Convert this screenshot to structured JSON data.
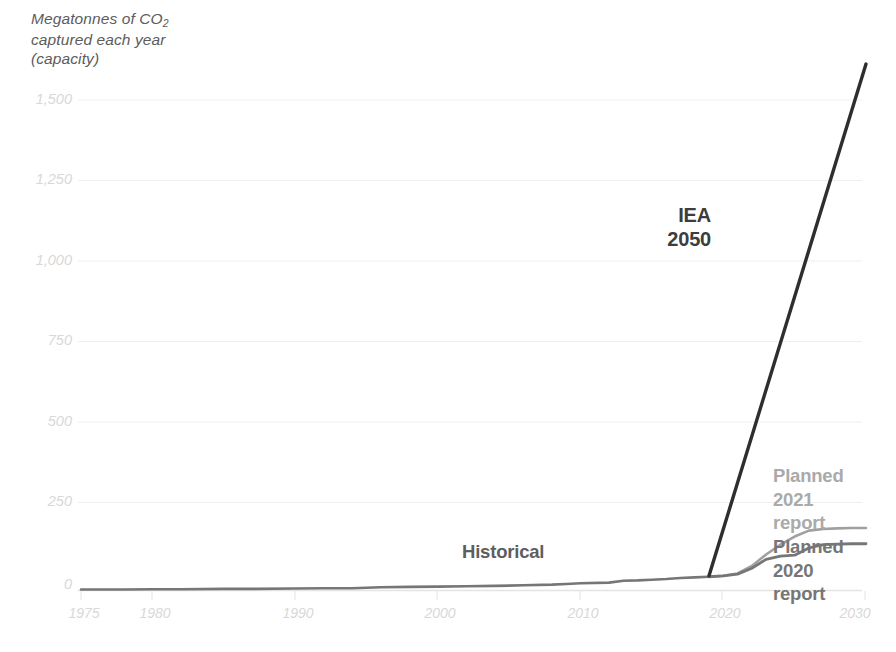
{
  "chart_data": {
    "type": "line",
    "title": "Megatonnes of CO2 captured each year (capacity)",
    "title_line1": "Megatonnes of CO",
    "title_sub": "2",
    "title_line2": "captured each year",
    "title_line3": "(capacity)",
    "xlabel": "",
    "ylabel": "Megatonnes of CO2 captured each year (capacity)",
    "xlim": [
      1975,
      2030
    ],
    "ylim": [
      0,
      1600
    ],
    "grid": true,
    "legend_position": "inline-right",
    "yticks": [
      0,
      250,
      500,
      750,
      1000,
      1250,
      1500
    ],
    "ytick_labels": [
      "0",
      "250",
      "500",
      "750",
      "1,000",
      "1,250",
      "1,500"
    ],
    "xticks": [
      1975,
      1980,
      1990,
      2000,
      2010,
      2020,
      2030
    ],
    "xtick_labels": [
      "1975",
      "1980",
      "1990",
      "2000",
      "2010",
      "2020",
      "2030"
    ],
    "annotations": [
      {
        "name": "iea-2050",
        "text": "IEA\n2050",
        "color": "#3d3d3d"
      },
      {
        "name": "historical",
        "text": "Historical",
        "color": "#5e5e5e"
      },
      {
        "name": "planned-2021-report",
        "text": "Planned\n2021\nreport",
        "color": "#aaaaaa"
      },
      {
        "name": "planned-2020-report",
        "text": "Planned\n2020\nreport",
        "color": "#767676"
      }
    ],
    "series": [
      {
        "name": "Historical",
        "color": "#767676",
        "points": [
          [
            1975,
            3
          ],
          [
            1978,
            3
          ],
          [
            1980,
            4
          ],
          [
            1982,
            4
          ],
          [
            1985,
            5
          ],
          [
            1987,
            5
          ],
          [
            1990,
            6
          ],
          [
            1992,
            7
          ],
          [
            1994,
            7
          ],
          [
            1996,
            10
          ],
          [
            1998,
            11
          ],
          [
            2000,
            12
          ],
          [
            2002,
            13
          ],
          [
            2004,
            14
          ],
          [
            2006,
            16
          ],
          [
            2008,
            18
          ],
          [
            2009,
            20
          ],
          [
            2010,
            22
          ],
          [
            2012,
            24
          ],
          [
            2013,
            30
          ],
          [
            2014,
            31
          ],
          [
            2015,
            33
          ],
          [
            2016,
            35
          ],
          [
            2017,
            38
          ],
          [
            2018,
            40
          ],
          [
            2019,
            42
          ]
        ]
      },
      {
        "name": "Planned 2021 report",
        "color": "#a0a0a0",
        "points": [
          [
            2019,
            42
          ],
          [
            2020,
            45
          ],
          [
            2021,
            52
          ],
          [
            2022,
            75
          ],
          [
            2023,
            110
          ],
          [
            2024,
            140
          ],
          [
            2025,
            165
          ],
          [
            2026,
            183
          ],
          [
            2027,
            188
          ],
          [
            2028,
            190
          ],
          [
            2029,
            191
          ],
          [
            2030,
            191
          ]
        ]
      },
      {
        "name": "Planned 2020 report",
        "color": "#767676",
        "points": [
          [
            2019,
            42
          ],
          [
            2020,
            45
          ],
          [
            2021,
            50
          ],
          [
            2022,
            68
          ],
          [
            2023,
            95
          ],
          [
            2024,
            105
          ],
          [
            2025,
            108
          ],
          [
            2026,
            130
          ],
          [
            2027,
            140
          ],
          [
            2028,
            142
          ],
          [
            2029,
            143
          ],
          [
            2030,
            143
          ]
        ]
      },
      {
        "name": "IEA 2050",
        "color": "#2e2e2e",
        "points": [
          [
            2019,
            45
          ],
          [
            2030,
            1610
          ]
        ]
      }
    ],
    "colors": {
      "historical": "#767676",
      "planned_2021": "#a0a0a0",
      "planned_2020": "#767676",
      "iea_2050": "#2e2e2e",
      "gridline": "#efefef",
      "axis": "#e4e4e4",
      "tick_label": "#d8d8d8",
      "title_text": "#5c5c5c"
    }
  }
}
